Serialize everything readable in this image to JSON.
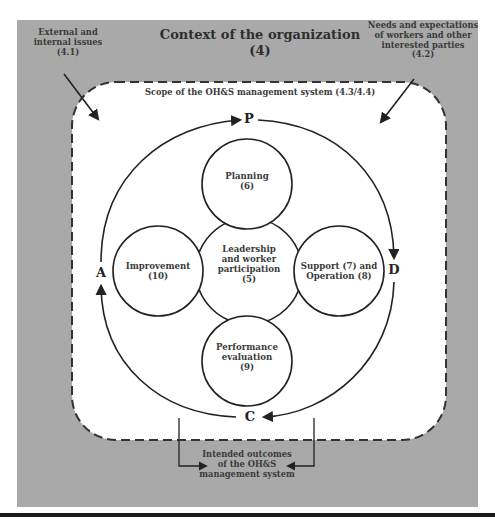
{
  "diagram": {
    "title": "Context of the organization",
    "title_ref": "(4)",
    "external_issues": "External and\ninternal issues\n(4.1)",
    "needs_expectations": "Needs and expectations\nof workers and other\ninterested parties\n(4.2)",
    "scope": "Scope of the OH&S management system (4.3/4.4)",
    "intended_outcomes": "Intended outcomes\nof the OH&S\nmanagement system",
    "cycle": {
      "P": "P",
      "D": "D",
      "C": "C",
      "A": "A"
    },
    "nodes": {
      "center": "Leadership\nand worker\nparticipation\n(5)",
      "top": "Planning\n(6)",
      "right": "Support (7) and\nOperation (8)",
      "bottom": "Performance\nevaluation\n(9)",
      "left": "Improvement\n(10)"
    },
    "colors": {
      "outer_background": "#a9a9a9",
      "scope_background": "#ffffff",
      "stroke": "#333333",
      "text": "#3a3a3a"
    }
  }
}
